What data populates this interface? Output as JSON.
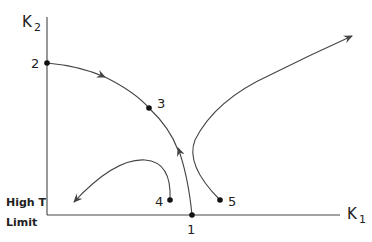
{
  "diagram": {
    "axes": {
      "x_label": "K",
      "x_subscript": "1",
      "y_label": "K",
      "y_subscript": "2",
      "corner_label_line1": "High T",
      "corner_label_line2": "Limit"
    },
    "points": [
      {
        "id": "1",
        "label": "1"
      },
      {
        "id": "2",
        "label": "2"
      },
      {
        "id": "3",
        "label": "3"
      },
      {
        "id": "4",
        "label": "4"
      },
      {
        "id": "5",
        "label": "5"
      }
    ],
    "trajectories": [
      {
        "id": "traj-2-3-1",
        "description": "from 2 through 3 toward 1 (arrow toward 3)"
      },
      {
        "id": "traj-1-up",
        "description": "from 1 upward toward 3"
      },
      {
        "id": "traj-4",
        "description": "from 4 curving to high T limit"
      },
      {
        "id": "traj-5",
        "description": "from 5 curving up and right"
      }
    ],
    "colors": {
      "line": "#444444",
      "point": "#111111",
      "background": "#ffffff"
    }
  }
}
